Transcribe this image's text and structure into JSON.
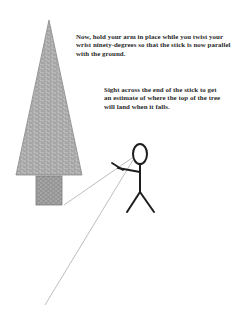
{
  "captions": {
    "step_instruction": "Now, hold your arm in place while you twist your wrist ninety-degrees so that the stick is now parallel with the ground.",
    "sight_instruction": "Sight across the end of the stick to get an estimate of where the top of the tree will land when it falls."
  },
  "figure": {
    "tree_fill": "#a8a8a8",
    "trunk_fill": "#9a9a9a",
    "stroke": "#1e1e1e",
    "sight_line": "#9a9a9a"
  }
}
